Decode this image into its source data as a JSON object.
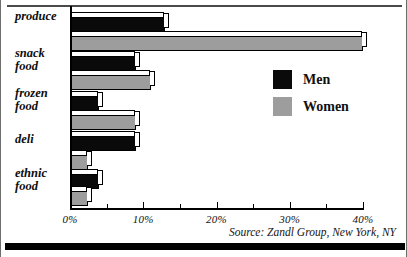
{
  "chart_data": {
    "type": "bar",
    "orientation": "horizontal",
    "title": "",
    "subtitle": "",
    "xlabel": "",
    "ylabel": "",
    "categories": [
      "produce",
      "snack food",
      "frozen food",
      "deli",
      "ethnic food"
    ],
    "category_lines": [
      [
        "produce"
      ],
      [
        "snack",
        "food"
      ],
      [
        "frozen",
        "food"
      ],
      [
        "deli"
      ],
      [
        "ethnic",
        "food"
      ]
    ],
    "series": [
      {
        "name": "Men",
        "color": "#0a0a0a",
        "values": [
          13,
          9,
          4,
          9,
          4
        ]
      },
      {
        "name": "Women",
        "color": "#9d9d9d",
        "values": [
          40,
          11,
          9,
          2.5,
          2.5
        ]
      }
    ],
    "xlim": [
      0,
      40
    ],
    "xticks": [
      0,
      10,
      20,
      30,
      40
    ],
    "xticklabels": [
      "0%",
      "10%",
      "20%",
      "30%",
      "40%"
    ],
    "minor_xticks": [
      5,
      15,
      25,
      35
    ],
    "grid": false,
    "legend_position": "center-right",
    "legend_entries": [
      {
        "label": "Men",
        "color": "#0a0a0a"
      },
      {
        "label": "Women",
        "color": "#9d9d9d"
      }
    ],
    "annotations": [
      "Source: Zandl Group, New York, NY"
    ]
  },
  "source_note": "Source: Zandl Group, New York, NY",
  "colors": {
    "men": "#0a0a0a",
    "women": "#9d9d9d",
    "axis": "#000000",
    "background": "#ffffff",
    "rule": "#4a4a4a"
  }
}
